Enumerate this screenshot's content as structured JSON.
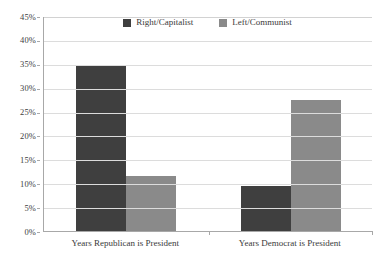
{
  "chart_data": {
    "type": "bar",
    "title": "",
    "subtitle": "",
    "xlabel": "",
    "ylabel": "",
    "categories": [
      "Years Republican is President",
      "Years Democrat is President"
    ],
    "series": [
      {
        "name": "Right/Capitalist",
        "color": "#3f3f3f",
        "values": [
          34.6,
          9.4
        ]
      },
      {
        "name": "Left/Communist",
        "color": "#8a8a8a",
        "values": [
          11.6,
          27.5
        ]
      }
    ],
    "ylim": [
      0,
      45
    ],
    "ytick_step": 5,
    "ytick_labels": [
      "0%",
      "5%",
      "10%",
      "15%",
      "20%",
      "25%",
      "30%",
      "35%",
      "40%",
      "45%"
    ],
    "ytick_values": [
      0,
      5,
      10,
      15,
      20,
      25,
      30,
      35,
      40,
      45
    ],
    "value_format": "percent",
    "grid": true,
    "grid_axis": "y",
    "legend_position": "top-center",
    "background_color": "#ffffff",
    "grid_color": "#dcdcdc",
    "axis_color": "#a8a8a8"
  }
}
